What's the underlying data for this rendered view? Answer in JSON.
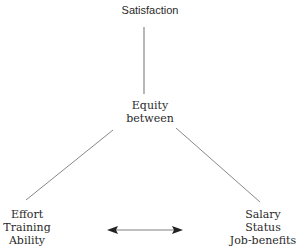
{
  "diagram": {
    "nodes": {
      "top": {
        "lines": [
          "Satisfaction"
        ]
      },
      "middle": {
        "lines": [
          "Equity",
          "between"
        ]
      },
      "left": {
        "lines": [
          "Effort",
          "Training",
          "Ability"
        ]
      },
      "right": {
        "lines": [
          "Salary",
          "Status",
          "Job-benefits"
        ]
      }
    },
    "edges": [
      {
        "from": "top",
        "to": "middle",
        "type": "line"
      },
      {
        "from": "middle",
        "to": "left",
        "type": "line"
      },
      {
        "from": "middle",
        "to": "right",
        "type": "line"
      },
      {
        "from": "left",
        "to": "right",
        "type": "double-arrow"
      }
    ],
    "colors": {
      "line": "#888888",
      "arrow": "#aaaaaa",
      "arrowhead": "#222222",
      "text": "#2a2a2a"
    }
  }
}
